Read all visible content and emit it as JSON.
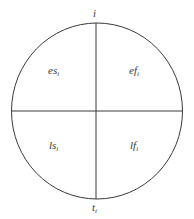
{
  "diagram": {
    "type": "activity-node-circle",
    "stroke_color": "#3a3a3a",
    "top_label": {
      "text": "i"
    },
    "bottom_label": {
      "text": "t",
      "sub": "i"
    },
    "quadrants": {
      "top_left": {
        "text": "es",
        "sub": "i"
      },
      "top_right": {
        "text": "ef",
        "sub": "i"
      },
      "bottom_left": {
        "text": "ls",
        "sub": "i"
      },
      "bottom_right": {
        "text": "lf",
        "sub": "i"
      }
    }
  }
}
